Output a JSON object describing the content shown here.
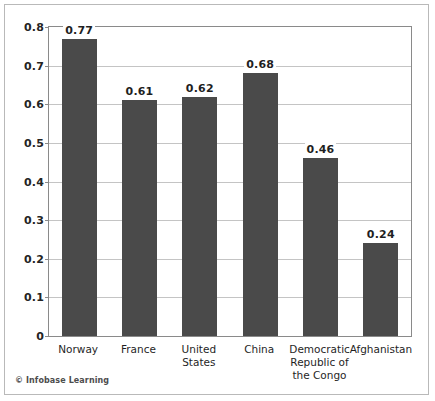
{
  "credit": {
    "symbol": "©",
    "text": "Infobase Learning"
  },
  "colors": {
    "bar_fill": "#4a4a4a",
    "grid": "#c4c4c4",
    "axis": "#8a8a8a",
    "frame": "#b9b9b9",
    "background": "#ffffff",
    "text": "#1f1f1f"
  },
  "chart_data": {
    "type": "bar",
    "title": "",
    "subtitle": "",
    "xlabel": "",
    "ylabel": "",
    "categories": [
      "Norway",
      "France",
      "United\nStates",
      "China",
      "Democratic\nRepublic of\nthe Congo",
      "Afghanistan"
    ],
    "values": [
      0.77,
      0.61,
      0.62,
      0.68,
      0.46,
      0.24
    ],
    "value_labels": [
      "0.77",
      "0.61",
      "0.62",
      "0.68",
      "0.46",
      "0.24"
    ],
    "ylim": [
      0,
      0.8
    ],
    "yticks": [
      0,
      0.1,
      0.2,
      0.3,
      0.4,
      0.5,
      0.6,
      0.7,
      0.8
    ],
    "ytick_labels": [
      "0",
      "0.1",
      "0.2",
      "0.3",
      "0.4",
      "0.5",
      "0.6",
      "0.7",
      "0.8"
    ],
    "grid": true,
    "grid_axis": "y",
    "legend": false,
    "legend_position": "none",
    "series": [
      {
        "name": "value",
        "values": [
          0.77,
          0.61,
          0.62,
          0.68,
          0.46,
          0.24
        ]
      }
    ]
  }
}
